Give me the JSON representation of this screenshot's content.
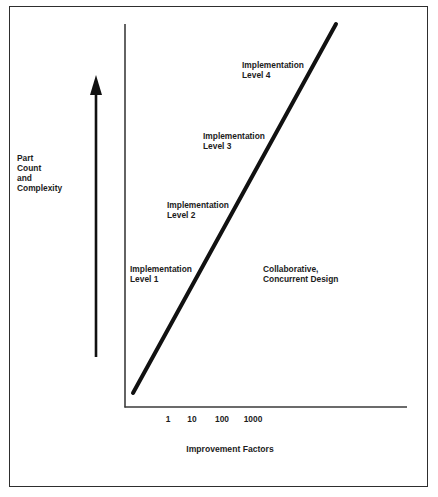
{
  "diagram": {
    "y_axis_label": [
      "Part",
      "Count",
      "and",
      "Complexity"
    ],
    "x_axis_label": "Improvement Factors",
    "x_ticks": [
      "1",
      "10",
      "100",
      "1000"
    ],
    "levels": [
      {
        "line1": "Implementation",
        "line2": "Level 1"
      },
      {
        "line1": "Implementation",
        "line2": "Level 2"
      },
      {
        "line1": "Implementation",
        "line2": "Level 3"
      },
      {
        "line1": "Implementation",
        "line2": "Level 4"
      }
    ],
    "region_label": [
      "Collaborative,",
      "Concurrent Design"
    ],
    "colors": {
      "ink": "#1a1a1a",
      "frame": "#2e2e2e",
      "background": "#ffffff"
    }
  }
}
